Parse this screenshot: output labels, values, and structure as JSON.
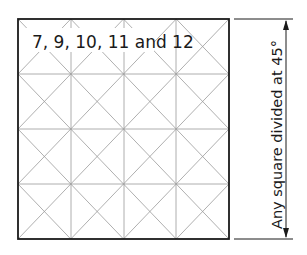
{
  "figure": {
    "title_label": "7, 9, 10, 11 and 12",
    "dimension_label": "Any square divided at 45°",
    "grid": {
      "rows": 4,
      "cols": 4,
      "diagonals": true,
      "diagonal_angle_deg": 45
    },
    "colors": {
      "border": "#1a1a1a",
      "grid_line": "#9a9a9a",
      "background": "#ffffff"
    }
  }
}
